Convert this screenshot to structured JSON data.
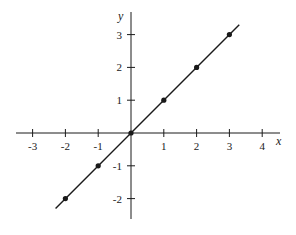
{
  "chart_data": {
    "type": "line",
    "title": "",
    "xlabel": "x",
    "ylabel": "y",
    "xlim": [
      -3.5,
      4.5
    ],
    "ylim": [
      -2.6,
      3.3
    ],
    "grid": false,
    "legend": null,
    "x_ticks": [
      -3,
      -2,
      -1,
      1,
      2,
      3,
      4
    ],
    "y_ticks": [
      -2,
      -1,
      1,
      2,
      3
    ],
    "x_tick_labels": [
      "-3",
      "-2",
      "-1",
      "1",
      "2",
      "3",
      "4"
    ],
    "y_tick_labels": [
      "-2",
      "-1",
      "1",
      "2",
      "3"
    ],
    "series": [
      {
        "name": "y = x",
        "line": {
          "x": [
            -2.3,
            3.3
          ],
          "y": [
            -2.3,
            3.3
          ]
        },
        "points": {
          "x": [
            -2,
            -1,
            0,
            1,
            2,
            3
          ],
          "y": [
            -2,
            -1,
            0,
            1,
            2,
            3
          ]
        }
      }
    ],
    "colors": {
      "line": "#1a1a1a",
      "axes": "#1a1a1a"
    }
  }
}
